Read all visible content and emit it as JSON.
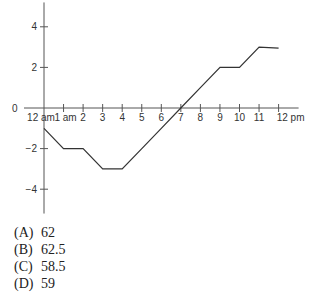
{
  "chart_data": {
    "type": "line",
    "title": "",
    "xlabel": "",
    "ylabel": "",
    "x": [
      0,
      1,
      2,
      3,
      4,
      5,
      6,
      7,
      8,
      9,
      10,
      11,
      12
    ],
    "x_tick_labels": [
      "12 am",
      "1 am",
      "2",
      "3",
      "4",
      "5",
      "6",
      "7",
      "8",
      "9",
      "10",
      "11",
      "12 pm"
    ],
    "y_ticks": [
      4,
      2,
      0,
      -2,
      -4
    ],
    "y_tick_labels": [
      "4",
      "2",
      "0",
      "−2",
      "−4"
    ],
    "ylim": [
      -5.2,
      5.2
    ],
    "xlim": [
      0,
      12
    ],
    "series": [
      {
        "name": "value",
        "values": [
          -1,
          -2,
          -2,
          -3,
          -3,
          -2,
          -1,
          0,
          1,
          2,
          2,
          3,
          2.95
        ]
      }
    ],
    "grid": false,
    "legend": "none"
  },
  "answer_choices": [
    {
      "letter": "(A)",
      "value": "62"
    },
    {
      "letter": "(B)",
      "value": "62.5"
    },
    {
      "letter": "(C)",
      "value": "58.5"
    },
    {
      "letter": "(D)",
      "value": "59"
    }
  ]
}
